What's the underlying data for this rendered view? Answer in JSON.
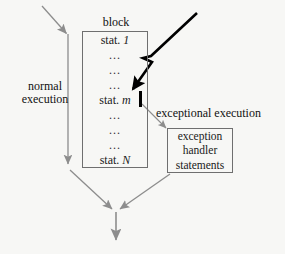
{
  "diagram": {
    "block": {
      "title": "block",
      "statements": [
        {
          "kind": "statement",
          "prefix": "stat. ",
          "index": "1"
        },
        {
          "kind": "ellipsis",
          "text": "..."
        },
        {
          "kind": "ellipsis",
          "text": "..."
        },
        {
          "kind": "ellipsis",
          "text": "..."
        },
        {
          "kind": "statement",
          "prefix": "stat. ",
          "index": "m"
        },
        {
          "kind": "ellipsis",
          "text": "..."
        },
        {
          "kind": "ellipsis",
          "text": "..."
        },
        {
          "kind": "ellipsis",
          "text": "..."
        },
        {
          "kind": "statement",
          "prefix": "stat. ",
          "index": "N"
        }
      ]
    },
    "labels": {
      "normal_execution_line1": "normal",
      "normal_execution_line2": "execution",
      "exceptional_execution": "exceptional execution"
    },
    "handler": {
      "line1": "exception",
      "line2": "handler",
      "line3": "statements"
    },
    "icons": {
      "lightning_bolt": "lightning-bolt-icon",
      "interrupt_bar": "interrupt-bar-icon",
      "entry_arrow": "entry-arrow-icon",
      "normal_flow_arrow": "normal-flow-arrow-icon",
      "exception_arrow": "exception-arrow-icon",
      "merge_arrow": "merge-arrow-icon",
      "exit_arrow": "exit-arrow-icon"
    },
    "colors": {
      "background": "#f7f7f5",
      "text": "#111111",
      "box_border": "#6f6f6f",
      "flow_arrow": "#8d8d8d",
      "bolt": "#000000"
    }
  }
}
